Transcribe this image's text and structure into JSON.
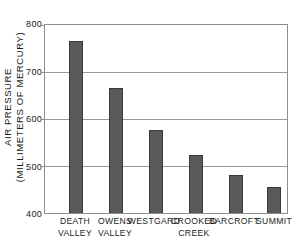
{
  "chart_data": {
    "type": "bar",
    "title": "",
    "xlabel": "",
    "ylabel": "AIR PRESSURE (MILLIMETERS OF MERCURY)",
    "ylabel_lines": [
      "AIR PRESSURE",
      "(MILLIMETERS OF MERCURY)"
    ],
    "categories": [
      "DEATH VALLEY",
      "OWENS VALLEY",
      "WESTGARD",
      "CROOKED CREEK",
      "BARCROFT",
      "SUMMIT"
    ],
    "category_lines": [
      [
        "DEATH",
        "VALLEY"
      ],
      [
        "OWENS",
        "VALLEY"
      ],
      [
        "WESTGARD",
        ""
      ],
      [
        "CROOKED",
        "CREEK"
      ],
      [
        "BARCROFT",
        ""
      ],
      [
        "SUMMIT",
        ""
      ]
    ],
    "values": [
      765,
      665,
      577,
      524,
      480,
      455
    ],
    "ylim": [
      400,
      800
    ],
    "yticks": [
      400,
      500,
      600,
      700,
      800
    ],
    "ytick_labels": [
      "400",
      "500",
      "600",
      "700",
      "800"
    ],
    "grid": true,
    "grid_axis": "y",
    "legend": false,
    "bar_color": "#5a5a5a",
    "bar_edge_color": "#3a3a3a",
    "axis_color": "#8d8d8d",
    "grid_color": "#9a9a9a",
    "background": "#ffffff"
  }
}
